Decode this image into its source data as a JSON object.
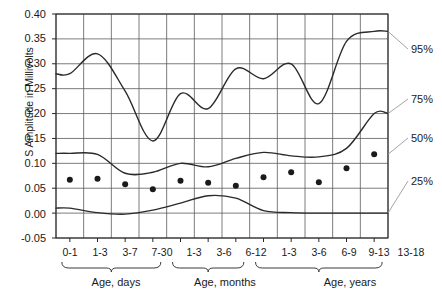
{
  "chart_data": {
    "type": "line",
    "title": "",
    "xlabel": "",
    "ylabel": "S Amplitude in Millivolts",
    "ylim": [
      -0.05,
      0.4
    ],
    "yticks": [
      0.4,
      0.35,
      0.3,
      0.25,
      0.2,
      0.15,
      0.1,
      0.05,
      0.0,
      -0.05
    ],
    "ytick_labels": [
      "0.40",
      "0.35",
      "0.30",
      "0.25",
      "0.20",
      "0.15",
      "0.10",
      "0.05",
      "0.00",
      "-0.05"
    ],
    "grid": true,
    "legend_position": "right-outside",
    "categories": [
      "0-1",
      "1-3",
      "3-7",
      "7-30",
      "1-3",
      "3-6",
      "6-12",
      "1-3",
      "3-6",
      "6-9",
      "9-13",
      "13-18"
    ],
    "groups": [
      {
        "label": "Age, days",
        "from": 0,
        "to": 3
      },
      {
        "label": "Age, months",
        "from": 4,
        "to": 6
      },
      {
        "label": "Age, years",
        "from": 7,
        "to": 11
      }
    ],
    "series": [
      {
        "name": "95%",
        "label": "95%",
        "color": "#2a2a2a",
        "values": [
          0.28,
          0.32,
          0.245,
          0.145,
          0.24,
          0.21,
          0.29,
          0.27,
          0.3,
          0.22,
          0.345,
          0.365
        ]
      },
      {
        "name": "75%",
        "label": "75%",
        "color": "#2a2a2a",
        "values": [
          0.12,
          0.118,
          0.08,
          0.082,
          0.1,
          0.093,
          0.11,
          0.122,
          0.115,
          0.113,
          0.13,
          0.2
        ]
      },
      {
        "name": "50%",
        "label": "50%",
        "color": "#2a2a2a",
        "marker": "dot",
        "values": [
          0.067,
          0.069,
          0.058,
          0.048,
          0.065,
          0.061,
          0.055,
          0.072,
          0.082,
          0.062,
          0.09,
          0.118
        ]
      },
      {
        "name": "25%",
        "label": "25%",
        "color": "#2a2a2a",
        "values": [
          0.01,
          0.001,
          -0.002,
          0.006,
          0.02,
          0.035,
          0.03,
          0.005,
          0.001,
          0.0,
          0.0,
          0.0
        ]
      }
    ],
    "median_points": [
      0.067,
      0.069,
      0.058,
      0.048,
      0.065,
      0.061,
      0.055,
      0.072,
      0.082,
      0.062,
      0.09,
      0.118
    ]
  }
}
